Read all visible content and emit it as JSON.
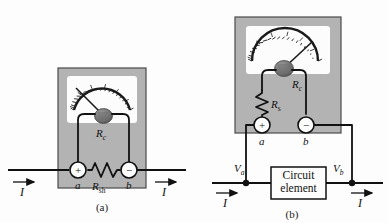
{
  "figure": {
    "background_color": "#fdfdfd",
    "meter_case_color": "#b3b3b3",
    "meter_face_color": "#fcfcfc",
    "wire_color": "#111111"
  },
  "panel_a": {
    "caption": "(a)",
    "name": "ammeter-with-shunt",
    "labels": {
      "coil_resistance": "R",
      "coil_resistance_sub": "c",
      "shunt_resistance": "R",
      "shunt_resistance_sub": "sh",
      "terminal_a": "a",
      "terminal_b": "b",
      "terminal_plus": "+",
      "terminal_minus": "−",
      "current_left": "I",
      "current_right": "I"
    }
  },
  "panel_b": {
    "caption": "(b)",
    "name": "voltmeter-across-circuit-element",
    "labels": {
      "coil_resistance": "R",
      "coil_resistance_sub": "c",
      "series_resistance": "R",
      "series_resistance_sub": "s",
      "terminal_a": "a",
      "terminal_b": "b",
      "terminal_plus": "+",
      "terminal_minus": "−",
      "potential_a": "V",
      "potential_a_sub": "a",
      "potential_b": "V",
      "potential_b_sub": "b",
      "circuit_element_line1": "Circuit",
      "circuit_element_line2": "element",
      "current_left": "I",
      "current_right": "I"
    }
  }
}
